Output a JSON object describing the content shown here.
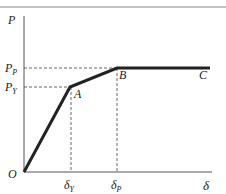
{
  "diagram": {
    "type": "elastic-plastic load-displacement curve",
    "axes": {
      "y_label": "P",
      "x_label": "δ",
      "origin_label": "O"
    },
    "y_ticks": [
      {
        "main": "P",
        "sub": "P",
        "name": "P_P"
      },
      {
        "main": "P",
        "sub": "Y",
        "name": "P_Y"
      }
    ],
    "x_ticks": [
      {
        "main": "δ",
        "sub": "Y",
        "name": "delta_Y"
      },
      {
        "main": "δ",
        "sub": "P",
        "name": "delta_P"
      }
    ],
    "points": [
      {
        "label": "A"
      },
      {
        "label": "B"
      },
      {
        "label": "C"
      }
    ],
    "colors": {
      "curve": "#222222",
      "axes": "#555555",
      "dashed": "#555555",
      "top_rule": "#888888"
    }
  }
}
